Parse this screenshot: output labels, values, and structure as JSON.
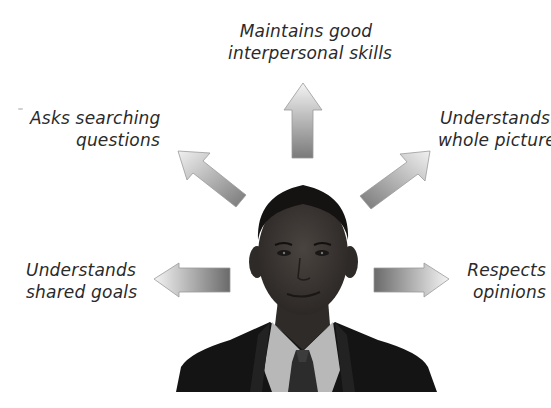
{
  "diagram": {
    "type": "radial-qualities",
    "center": {
      "subject": "portrait of a man in a dark suit, white shirt and tie",
      "icon": "person-portrait"
    },
    "qualities": [
      {
        "id": "top",
        "direction": "up",
        "line1": "Maintains good",
        "line2": "interpersonal skills"
      },
      {
        "id": "upper-left",
        "direction": "up-left",
        "line1": "Asks searching",
        "line2": "questions"
      },
      {
        "id": "upper-right",
        "direction": "up-right",
        "line1": "Understands",
        "line2": "whole picture"
      },
      {
        "id": "left",
        "direction": "left",
        "line1": "Understands",
        "line2": "shared goals"
      },
      {
        "id": "right",
        "direction": "right",
        "line1": "Respects",
        "line2": "opinions"
      }
    ],
    "colors": {
      "text": "#2a2a2a",
      "arrow_light": "#f2f2f2",
      "arrow_dark": "#6e6e6e",
      "suit": "#141414",
      "skin": "#3a3532",
      "shirt": "#bdbdbd"
    }
  }
}
